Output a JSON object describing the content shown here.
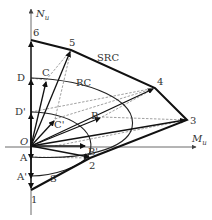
{
  "axes": {
    "vertical": {
      "label": "N",
      "subscript": "u"
    },
    "horizontal": {
      "label": "M",
      "subscript": "u"
    },
    "origin_label": "O"
  },
  "curves": {
    "src_label": "SRC",
    "rc_label": "RC",
    "s_label": "S"
  },
  "points": {
    "p1": "1",
    "p2": "2",
    "p3": "3",
    "p4": "4",
    "p5": "5",
    "p6": "6",
    "A": "A",
    "A_prime": "A'",
    "B": "B",
    "B_prime": "B'",
    "C": "C",
    "C_prime": "C'",
    "D": "D",
    "D_prime": "D'"
  }
}
